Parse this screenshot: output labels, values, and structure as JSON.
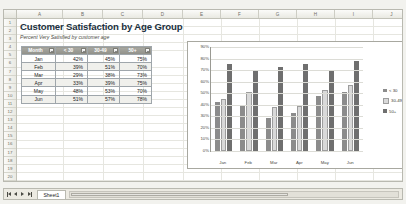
{
  "document": {
    "title": "Customer Satisfaction by Age Group",
    "subtitle": "Percent Very Satisfied by customer age"
  },
  "grid": {
    "columns": [
      "A",
      "B",
      "C",
      "D",
      "E",
      "F",
      "G",
      "H",
      "I",
      "J"
    ],
    "rows": [
      "1",
      "2",
      "3",
      "4",
      "5",
      "6",
      "7",
      "8",
      "9",
      "10",
      "11",
      "12",
      "13",
      "14",
      "15",
      "16",
      "17",
      "18",
      "19",
      "20"
    ]
  },
  "table": {
    "headers": [
      "Month",
      "< 30",
      "30-49",
      "50+"
    ],
    "rows": [
      {
        "month": "Jan",
        "lt30": "42%",
        "mid": "45%",
        "plus50": "75%"
      },
      {
        "month": "Feb",
        "lt30": "39%",
        "mid": "51%",
        "plus50": "70%"
      },
      {
        "month": "Mar",
        "lt30": "29%",
        "mid": "38%",
        "plus50": "73%"
      },
      {
        "month": "Apr",
        "lt30": "33%",
        "mid": "39%",
        "plus50": "75%"
      },
      {
        "month": "May",
        "lt30": "48%",
        "mid": "53%",
        "plus50": "70%"
      },
      {
        "month": "Jun",
        "lt30": "51%",
        "mid": "57%",
        "plus50": "78%"
      }
    ],
    "filter_icon": "filter-dropdown-icon"
  },
  "chart_data": {
    "type": "bar",
    "title": "",
    "xlabel": "",
    "ylabel": "",
    "categories": [
      "Jan",
      "Feb",
      "Mar",
      "Apr",
      "May",
      "Jun"
    ],
    "series": [
      {
        "name": "< 30",
        "values": [
          42,
          39,
          29,
          33,
          48,
          51
        ],
        "color": "#8c8c8c"
      },
      {
        "name": "30-49",
        "values": [
          45,
          51,
          38,
          39,
          53,
          57
        ],
        "color": "#d9d9d9"
      },
      {
        "name": "50+",
        "values": [
          75,
          70,
          73,
          75,
          70,
          78
        ],
        "color": "#6f6f6f"
      }
    ],
    "ylim": [
      0,
      90
    ],
    "yticks": [
      "0%",
      "10%",
      "20%",
      "30%",
      "40%",
      "50%",
      "60%",
      "70%",
      "80%",
      "90%"
    ],
    "grid": true,
    "legend_position": "right"
  },
  "sheetbar": {
    "tab_label": "Sheet1",
    "nav_first": "first-sheet-icon",
    "nav_prev": "previous-sheet-icon",
    "nav_next": "next-sheet-icon",
    "nav_last": "last-sheet-icon"
  }
}
